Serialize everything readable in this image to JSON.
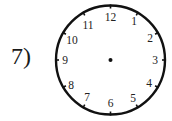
{
  "problem": {
    "label": "7)"
  },
  "clock": {
    "center": [
      110.5,
      60
    ],
    "radius": 54.5,
    "stroke_color": "#111111",
    "numbers": [
      "12",
      "1",
      "2",
      "3",
      "4",
      "5",
      "6",
      "7",
      "8",
      "9",
      "10",
      "11"
    ],
    "center_dot": true,
    "hands": []
  }
}
